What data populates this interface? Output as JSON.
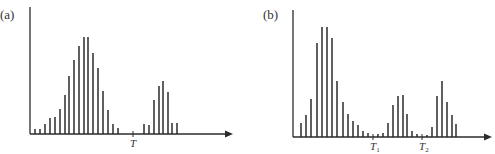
{
  "colors": {
    "ink": "#2b2b2b",
    "background": "#ffffff"
  },
  "chart_data": [
    {
      "type": "bar",
      "panel_label": "(a)",
      "title": "",
      "xlabel": "",
      "ylabel": "",
      "x_ticks": [
        {
          "label": "T",
          "x": 133
        }
      ],
      "grid": false,
      "legend": null,
      "axis": {
        "origin_x": 30,
        "baseline_y": 134,
        "top_y": 7,
        "arrow_x": 233
      },
      "bars": [
        {
          "x": 35,
          "top": 129
        },
        {
          "x": 40,
          "top": 129
        },
        {
          "x": 45,
          "top": 124
        },
        {
          "x": 50,
          "top": 118
        },
        {
          "x": 55,
          "top": 117
        },
        {
          "x": 60,
          "top": 109
        },
        {
          "x": 65,
          "top": 95
        },
        {
          "x": 69,
          "top": 76
        },
        {
          "x": 74,
          "top": 60
        },
        {
          "x": 79,
          "top": 46
        },
        {
          "x": 84,
          "top": 37
        },
        {
          "x": 88,
          "top": 37
        },
        {
          "x": 93,
          "top": 53
        },
        {
          "x": 98,
          "top": 68
        },
        {
          "x": 103,
          "top": 91
        },
        {
          "x": 108,
          "top": 110
        },
        {
          "x": 113,
          "top": 124
        },
        {
          "x": 118,
          "top": 128
        },
        {
          "x": 144,
          "top": 124
        },
        {
          "x": 149,
          "top": 125
        },
        {
          "x": 154,
          "top": 100
        },
        {
          "x": 159,
          "top": 86
        },
        {
          "x": 163,
          "top": 81
        },
        {
          "x": 168,
          "top": 92
        },
        {
          "x": 172,
          "top": 123
        },
        {
          "x": 177,
          "top": 123
        }
      ],
      "description": "Bimodal histogram with a large mode on the left and a smaller mode on the right, separated by threshold T"
    },
    {
      "type": "bar",
      "panel_label": "(b)",
      "title": "",
      "xlabel": "",
      "ylabel": "",
      "x_ticks": [
        {
          "label": "T",
          "sub": "1",
          "x": 373
        },
        {
          "label": "T",
          "sub": "2",
          "x": 422
        }
      ],
      "grid": false,
      "legend": null,
      "axis": {
        "origin_x": 293,
        "baseline_y": 137,
        "top_y": 10,
        "arrow_x": 492
      },
      "bars": [
        {
          "x": 301,
          "top": 123
        },
        {
          "x": 306,
          "top": 115
        },
        {
          "x": 311,
          "top": 99
        },
        {
          "x": 317,
          "top": 43
        },
        {
          "x": 322,
          "top": 27
        },
        {
          "x": 327,
          "top": 27
        },
        {
          "x": 332,
          "top": 38
        },
        {
          "x": 337,
          "top": 81
        },
        {
          "x": 343,
          "top": 102
        },
        {
          "x": 348,
          "top": 114
        },
        {
          "x": 353,
          "top": 121
        },
        {
          "x": 358,
          "top": 125
        },
        {
          "x": 363,
          "top": 131
        },
        {
          "x": 368,
          "top": 133
        },
        {
          "x": 378,
          "top": 134
        },
        {
          "x": 383,
          "top": 133
        },
        {
          "x": 388,
          "top": 123
        },
        {
          "x": 393,
          "top": 105
        },
        {
          "x": 398,
          "top": 96
        },
        {
          "x": 403,
          "top": 95
        },
        {
          "x": 407,
          "top": 114
        },
        {
          "x": 412,
          "top": 131
        },
        {
          "x": 417,
          "top": 134
        },
        {
          "x": 427,
          "top": 135
        },
        {
          "x": 432,
          "top": 127
        },
        {
          "x": 437,
          "top": 96
        },
        {
          "x": 442,
          "top": 81
        },
        {
          "x": 447,
          "top": 102
        },
        {
          "x": 452,
          "top": 115
        },
        {
          "x": 456,
          "top": 124
        }
      ],
      "description": "Trimodal histogram with three peaks separated by thresholds T1 and T2"
    }
  ]
}
